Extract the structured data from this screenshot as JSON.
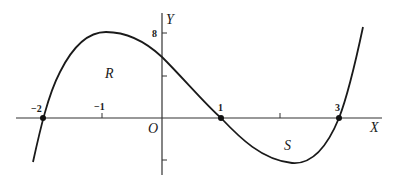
{
  "figure": {
    "axes": {
      "x_label": "X",
      "y_label": "Y",
      "origin_label": "O",
      "x_ticks": [
        {
          "value": -2,
          "label": "−2"
        },
        {
          "value": -1,
          "label": "−1"
        },
        {
          "value": 1,
          "label": "1"
        },
        {
          "value": 2,
          "label": ""
        },
        {
          "value": 3,
          "label": "3"
        }
      ],
      "y_ticks": [
        {
          "value": 8,
          "label": "8"
        },
        {
          "value": 4,
          "label": ""
        },
        {
          "value": -4,
          "label": ""
        }
      ]
    },
    "curve": {
      "description": "Cubic curve crossing x-axis at -2, 1, 3",
      "roots": [
        -2,
        1,
        3
      ],
      "color": "#1a1a1a"
    },
    "regions": [
      {
        "label": "R",
        "position": "above x-axis between -2 and 1"
      },
      {
        "label": "S",
        "position": "below x-axis between 1 and 3"
      }
    ],
    "root_labels": {
      "left": "−2",
      "mid": "1",
      "right": "3"
    }
  }
}
